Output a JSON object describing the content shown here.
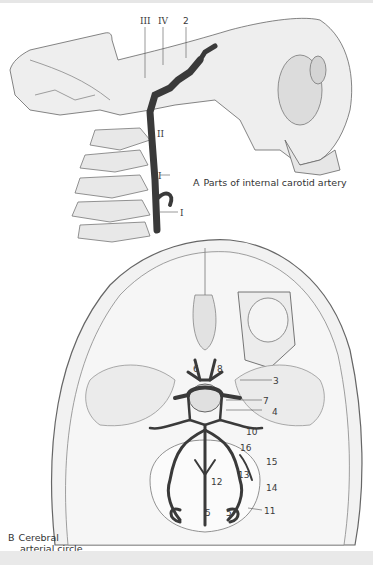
{
  "figure": {
    "panel_a": {
      "letter": "A",
      "caption": "Parts of internal carotid artery",
      "labels": [
        "III",
        "IV",
        "2",
        "II",
        "I",
        "I"
      ]
    },
    "panel_b": {
      "letter": "B",
      "caption_line1": "Cerebral",
      "caption_line2": "arterial circle",
      "labels": [
        "6",
        "8",
        "3",
        "7",
        "4",
        "10",
        "16",
        "15",
        "13",
        "14",
        "12",
        "5",
        "5",
        "11"
      ]
    },
    "colors": {
      "background": "#ffffff",
      "bone_fill": "#ececec",
      "line": "#555555",
      "artery": "#3a3a3a",
      "band": "#e9e9e9"
    }
  }
}
